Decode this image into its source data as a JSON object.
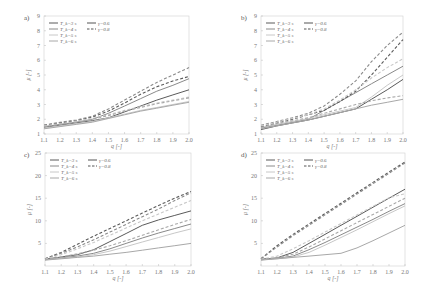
{
  "figure": {
    "legend": {
      "period_entries": [
        "T_k=3 s",
        "T_k=4 s",
        "T_k=5 s",
        "T_k=6 s"
      ],
      "gamma_entries": [
        "γ=0.6",
        "γ=0.8"
      ]
    },
    "xlabel": "q [-]",
    "ylabel": "μ [-]"
  },
  "colors": {
    "T3": "#5a5a5a",
    "T4": "#8a8a8a",
    "T5": "#c8c8c8",
    "T6": "#a8a8a8",
    "axis": "#d0d0d0"
  },
  "chart_data": [
    {
      "type": "line",
      "panel": "a)",
      "xlabel": "q [-]",
      "ylabel": "μ [-]",
      "xlim": [
        1.1,
        2.0
      ],
      "ylim": [
        1,
        9
      ],
      "xticks": [
        1.1,
        1.2,
        1.3,
        1.4,
        1.5,
        1.6,
        1.7,
        1.8,
        1.9,
        2.0
      ],
      "yticks": [
        1,
        2,
        3,
        4,
        5,
        6,
        7,
        8,
        9
      ],
      "x": [
        1.1,
        1.2,
        1.3,
        1.4,
        1.5,
        1.6,
        1.7,
        1.8,
        1.9,
        2.0
      ],
      "series": [
        {
          "name": "T_k=3 s, γ=0.6",
          "style": "solid",
          "color": "T3",
          "values": [
            1.45,
            1.6,
            1.75,
            1.9,
            2.1,
            2.5,
            2.9,
            3.3,
            3.65,
            4.0
          ]
        },
        {
          "name": "T_k=4 s, γ=0.6",
          "style": "solid",
          "color": "T4",
          "values": [
            1.5,
            1.65,
            1.8,
            2.0,
            2.4,
            2.9,
            3.4,
            3.9,
            4.3,
            4.75
          ]
        },
        {
          "name": "T_k=5 s, γ=0.6",
          "style": "solid",
          "color": "T5",
          "values": [
            1.4,
            1.55,
            1.7,
            1.85,
            2.1,
            2.35,
            2.6,
            2.8,
            3.0,
            3.2
          ]
        },
        {
          "name": "T_k=6 s, γ=0.6",
          "style": "solid",
          "color": "T6",
          "values": [
            1.35,
            1.5,
            1.65,
            1.8,
            2.05,
            2.3,
            2.55,
            2.75,
            2.95,
            3.15
          ]
        },
        {
          "name": "T_k=3 s, γ=0.8",
          "style": "dashed",
          "color": "T3",
          "values": [
            1.6,
            1.75,
            1.9,
            2.15,
            2.55,
            3.1,
            3.7,
            4.2,
            4.6,
            4.9
          ]
        },
        {
          "name": "T_k=4 s, γ=0.8",
          "style": "dashed",
          "color": "T4",
          "values": [
            1.6,
            1.8,
            1.95,
            2.2,
            2.7,
            3.3,
            3.9,
            4.5,
            5.0,
            5.5
          ]
        },
        {
          "name": "T_k=5 s, γ=0.8",
          "style": "dashed",
          "color": "T5",
          "values": [
            1.55,
            1.7,
            1.85,
            2.05,
            2.3,
            2.6,
            2.85,
            3.1,
            3.3,
            3.5
          ]
        },
        {
          "name": "T_k=6 s, γ=0.8",
          "style": "dashed",
          "color": "T6",
          "values": [
            1.5,
            1.65,
            1.8,
            2.0,
            2.25,
            2.55,
            2.8,
            3.05,
            3.25,
            3.45
          ]
        }
      ]
    },
    {
      "type": "line",
      "panel": "b)",
      "xlabel": "q [-]",
      "ylabel": "μ [-]",
      "xlim": [
        1.1,
        2.0
      ],
      "ylim": [
        1,
        9
      ],
      "xticks": [
        1.1,
        1.2,
        1.3,
        1.4,
        1.5,
        1.6,
        1.7,
        1.8,
        1.9,
        2.0
      ],
      "yticks": [
        1,
        2,
        3,
        4,
        5,
        6,
        7,
        8,
        9
      ],
      "x": [
        1.1,
        1.2,
        1.3,
        1.4,
        1.5,
        1.6,
        1.7,
        1.8,
        1.9,
        2.0
      ],
      "series": [
        {
          "name": "T_k=3 s, γ=0.6",
          "style": "solid",
          "color": "T3",
          "values": [
            1.3,
            1.55,
            1.75,
            1.95,
            2.2,
            2.45,
            2.7,
            3.35,
            4.0,
            4.7
          ]
        },
        {
          "name": "T_k=4 s, γ=0.6",
          "style": "solid",
          "color": "T4",
          "values": [
            1.4,
            1.6,
            1.8,
            2.0,
            2.6,
            3.2,
            3.8,
            4.4,
            5.0,
            5.6
          ]
        },
        {
          "name": "T_k=5 s, γ=0.6",
          "style": "solid",
          "color": "T5",
          "values": [
            1.45,
            1.65,
            1.85,
            2.05,
            2.3,
            2.55,
            2.8,
            3.5,
            4.3,
            5.0
          ]
        },
        {
          "name": "T_k=6 s, γ=0.6",
          "style": "solid",
          "color": "T6",
          "values": [
            1.35,
            1.55,
            1.75,
            1.95,
            2.2,
            2.45,
            2.7,
            2.95,
            3.15,
            3.35
          ]
        },
        {
          "name": "T_k=3 s, γ=0.8",
          "style": "dashed",
          "color": "T3",
          "values": [
            1.5,
            1.75,
            2.0,
            2.3,
            2.6,
            3.2,
            3.9,
            5.0,
            6.2,
            7.4
          ]
        },
        {
          "name": "T_k=4 s, γ=0.8",
          "style": "dashed",
          "color": "T4",
          "values": [
            1.6,
            1.85,
            2.1,
            2.4,
            2.9,
            3.7,
            4.6,
            5.9,
            7.0,
            7.9
          ]
        },
        {
          "name": "T_k=5 s, γ=0.8",
          "style": "dashed",
          "color": "T5",
          "values": [
            1.55,
            1.8,
            2.05,
            2.3,
            2.7,
            3.3,
            4.0,
            4.8,
            5.5,
            6.1
          ]
        },
        {
          "name": "T_k=6 s, γ=0.8",
          "style": "dashed",
          "color": "T6",
          "values": [
            1.45,
            1.7,
            1.9,
            2.1,
            2.4,
            2.7,
            3.0,
            3.25,
            3.45,
            3.6
          ]
        }
      ]
    },
    {
      "type": "line",
      "panel": "c)",
      "xlabel": "q [-]",
      "ylabel": "μ [-]",
      "xlim": [
        1.1,
        2.0
      ],
      "ylim": [
        0,
        25
      ],
      "xticks": [
        1.1,
        1.2,
        1.3,
        1.4,
        1.5,
        1.6,
        1.7,
        1.8,
        1.9,
        2.0
      ],
      "yticks": [
        5,
        10,
        15,
        20,
        25
      ],
      "x": [
        1.1,
        1.2,
        1.3,
        1.4,
        1.5,
        1.6,
        1.7,
        1.8,
        1.9,
        2.0
      ],
      "series": [
        {
          "name": "T_k=3 s, γ=0.6",
          "style": "solid",
          "color": "T3",
          "values": [
            1.5,
            2.0,
            2.5,
            3.6,
            5.4,
            7.2,
            9.0,
            10.2,
            11.2,
            12.2
          ]
        },
        {
          "name": "T_k=4 s, γ=0.6",
          "style": "solid",
          "color": "T4",
          "values": [
            1.4,
            1.8,
            2.2,
            2.8,
            3.8,
            5.0,
            6.2,
            7.3,
            8.3,
            9.3
          ]
        },
        {
          "name": "T_k=5 s, γ=0.6",
          "style": "solid",
          "color": "T5",
          "values": [
            1.35,
            1.7,
            2.0,
            2.5,
            3.3,
            4.3,
            5.3,
            6.3,
            7.3,
            8.2
          ]
        },
        {
          "name": "T_k=6 s, γ=0.6",
          "style": "solid",
          "color": "T6",
          "values": [
            1.3,
            1.6,
            1.9,
            2.2,
            2.6,
            3.0,
            3.5,
            4.0,
            4.5,
            5.0
          ]
        },
        {
          "name": "T_k=3 s, γ=0.8",
          "style": "dashed",
          "color": "T3",
          "values": [
            1.6,
            3.0,
            4.8,
            6.6,
            8.3,
            10.0,
            11.7,
            13.4,
            15.0,
            16.5
          ]
        },
        {
          "name": "T_k=4 s, γ=0.8",
          "style": "dashed",
          "color": "T4",
          "values": [
            1.6,
            2.8,
            4.2,
            5.8,
            7.5,
            9.2,
            10.9,
            12.6,
            14.5,
            16.2
          ]
        },
        {
          "name": "T_k=5 s, γ=0.8",
          "style": "dashed",
          "color": "T5",
          "values": [
            1.5,
            2.5,
            3.8,
            5.2,
            6.8,
            8.4,
            10.0,
            11.5,
            13.0,
            14.5
          ]
        },
        {
          "name": "T_k=6 s, γ=0.8",
          "style": "dashed",
          "color": "T6",
          "values": [
            1.4,
            2.0,
            2.7,
            3.5,
            4.5,
            5.6,
            6.8,
            8.0,
            9.2,
            10.3
          ]
        }
      ]
    },
    {
      "type": "line",
      "panel": "d)",
      "xlabel": "q [-]",
      "ylabel": "μ [-]",
      "xlim": [
        1.1,
        2.0
      ],
      "ylim": [
        0,
        25
      ],
      "xticks": [
        1.1,
        1.2,
        1.3,
        1.4,
        1.5,
        1.6,
        1.7,
        1.8,
        1.9,
        2.0
      ],
      "yticks": [
        5,
        10,
        15,
        20,
        25
      ],
      "x": [
        1.1,
        1.2,
        1.3,
        1.4,
        1.5,
        1.6,
        1.7,
        1.8,
        1.9,
        2.0
      ],
      "series": [
        {
          "name": "T_k=3 s, γ=0.6",
          "style": "solid",
          "color": "T3",
          "values": [
            1.5,
            1.8,
            3.0,
            5.0,
            7.0,
            9.0,
            11.0,
            13.0,
            15.0,
            17.0
          ]
        },
        {
          "name": "T_k=4 s, γ=0.6",
          "style": "solid",
          "color": "T4",
          "values": [
            1.4,
            1.7,
            2.2,
            3.6,
            5.2,
            6.9,
            8.6,
            10.3,
            12.1,
            13.8
          ]
        },
        {
          "name": "T_k=5 s, γ=0.6",
          "style": "solid",
          "color": "T5",
          "values": [
            1.35,
            1.6,
            2.0,
            3.0,
            4.6,
            6.3,
            8.0,
            9.8,
            11.6,
            13.3
          ]
        },
        {
          "name": "T_k=6 s, γ=0.6",
          "style": "solid",
          "color": "T6",
          "values": [
            1.3,
            1.6,
            1.9,
            2.2,
            2.5,
            2.8,
            4.0,
            5.6,
            7.3,
            9.0
          ]
        },
        {
          "name": "T_k=3 s, γ=0.8",
          "style": "dashed",
          "color": "T3",
          "values": [
            1.6,
            4.5,
            7.0,
            9.3,
            11.6,
            13.9,
            16.2,
            18.5,
            20.8,
            23.0
          ]
        },
        {
          "name": "T_k=4 s, γ=0.8",
          "style": "dashed",
          "color": "T4",
          "values": [
            1.6,
            4.2,
            6.7,
            9.0,
            11.3,
            13.6,
            15.9,
            18.2,
            20.5,
            22.8
          ]
        },
        {
          "name": "T_k=5 s, γ=0.8",
          "style": "dashed",
          "color": "T5",
          "values": [
            1.5,
            2.2,
            3.8,
            5.6,
            7.5,
            9.4,
            11.3,
            13.2,
            15.1,
            16.0
          ]
        },
        {
          "name": "T_k=6 s, γ=0.8",
          "style": "dashed",
          "color": "T6",
          "values": [
            1.4,
            1.8,
            2.6,
            4.2,
            6.0,
            7.8,
            9.6,
            11.4,
            13.2,
            15.0
          ]
        }
      ]
    }
  ]
}
